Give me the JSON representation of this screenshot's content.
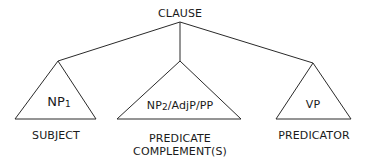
{
  "diagram": {
    "type": "syntax-tree",
    "root": {
      "label": "CLAUSE"
    },
    "children": [
      {
        "node_main": "NP",
        "node_sub": "1",
        "function_label": "SUBJECT"
      },
      {
        "node_main": "NP",
        "node_sub": "2",
        "node_rest": "/AdjP/PP",
        "function_label_line1": "PREDICATE",
        "function_label_line2": "COMPLEMENT(S)"
      },
      {
        "node_main": "VP",
        "function_label": "PREDICATOR"
      }
    ],
    "colors": {
      "line": "#2a2a2a",
      "text": "#1a1a1a",
      "background": "#ffffff"
    }
  }
}
